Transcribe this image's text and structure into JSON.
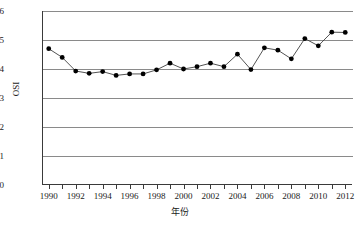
{
  "chart_data": {
    "type": "line",
    "title": "",
    "xlabel": "年份",
    "ylabel": "OSI",
    "x": [
      1990,
      1991,
      1992,
      1993,
      1994,
      1995,
      1996,
      1997,
      1998,
      1999,
      2000,
      2001,
      2002,
      2003,
      2004,
      2005,
      2006,
      2007,
      2008,
      2009,
      2010,
      2011,
      2012
    ],
    "values": [
      0.047,
      0.044,
      0.0393,
      0.0385,
      0.0391,
      0.0378,
      0.0383,
      0.0383,
      0.0397,
      0.042,
      0.04,
      0.0408,
      0.042,
      0.0408,
      0.0451,
      0.0398,
      0.0473,
      0.0465,
      0.0435,
      0.0505,
      0.048,
      0.0527,
      0.0526
    ],
    "series": [
      {
        "name": "OSI",
        "values": [
          0.047,
          0.044,
          0.0393,
          0.0385,
          0.0391,
          0.0378,
          0.0383,
          0.0383,
          0.0397,
          0.042,
          0.04,
          0.0408,
          0.042,
          0.0408,
          0.0451,
          0.0398,
          0.0473,
          0.0465,
          0.0435,
          0.0505,
          0.048,
          0.0527,
          0.0526
        ],
        "color": "#000000",
        "marker": "filled-circle"
      }
    ],
    "xlim": [
      1989.5,
      2012.5
    ],
    "ylim": [
      0,
      0.06
    ],
    "yticks": [
      0,
      0.01,
      0.02,
      0.03,
      0.04,
      0.05,
      0.06
    ],
    "ytick_labels": [
      "0",
      "0.01",
      "0.02",
      "0.03",
      "0.04",
      "0.05",
      "0.06"
    ],
    "xticks": [
      1990,
      1991,
      1992,
      1993,
      1994,
      1995,
      1996,
      1997,
      1998,
      1999,
      2000,
      2001,
      2002,
      2003,
      2004,
      2005,
      2006,
      2007,
      2008,
      2009,
      2010,
      2011,
      2012
    ],
    "xtick_labels_shown": [
      "1990",
      "1992",
      "1994",
      "1996",
      "1998",
      "2000",
      "2002",
      "2004",
      "2006",
      "2008",
      "2010",
      "2012"
    ],
    "grid": "horizontal",
    "legend": "none",
    "colors": {
      "grid": "#8a8a8a",
      "axis": "#3a3a3a",
      "line": "#404040",
      "marker": "#000000",
      "background": "#ffffff",
      "text": "#1a1a1a"
    }
  }
}
